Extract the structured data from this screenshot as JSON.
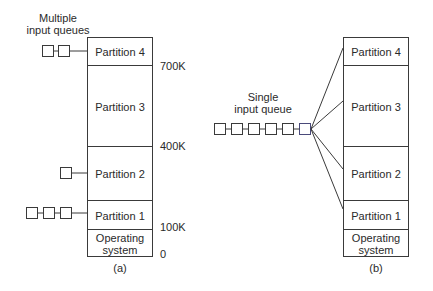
{
  "diagram_a": {
    "title": "Multiple input queues",
    "title_lines": [
      "Multiple",
      "input queues"
    ],
    "caption": "(a)",
    "partitions": [
      {
        "label": "Partition 4",
        "queue_length": 2
      },
      {
        "label": "Partition 3",
        "queue_length": 0
      },
      {
        "label": "Partition 2",
        "queue_length": 1
      },
      {
        "label": "Partition 1",
        "queue_length": 3
      },
      {
        "label_lines": [
          "Operating",
          "system"
        ]
      }
    ],
    "address_labels": [
      "700K",
      "400K",
      "100K",
      "0"
    ]
  },
  "diagram_b": {
    "title_lines": [
      "Single",
      "input queue"
    ],
    "caption": "(b)",
    "queue_length": 6,
    "partitions": [
      {
        "label": "Partition 4"
      },
      {
        "label": "Partition 3"
      },
      {
        "label": "Partition 2"
      },
      {
        "label": "Partition 1"
      },
      {
        "label_lines": [
          "Operating",
          "system"
        ]
      }
    ]
  }
}
